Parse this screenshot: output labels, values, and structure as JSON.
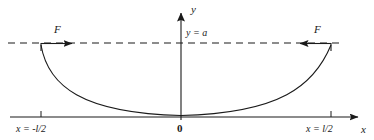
{
  "figure": {
    "type": "diagram",
    "width": 374,
    "height": 140,
    "background_color": "#ffffff",
    "stroke_color": "#1a1a1a"
  },
  "axes": {
    "y_axis_label": "y",
    "x_axis_label": "x",
    "origin_label": "0",
    "x_axis_y_px": 117,
    "y_axis_x_px": 181,
    "x_axis_from_px": 10,
    "x_axis_to_px": 365,
    "y_axis_from_px": 8,
    "y_axis_to_px": 120
  },
  "level_line": {
    "label": "y = a",
    "style": "dashed",
    "y_px": 43,
    "from_px": 8,
    "to_px": 340
  },
  "forces": [
    {
      "label": "F",
      "side": "left",
      "direction": "right",
      "anchor_x_px": 41,
      "tip_x_px": 78
    },
    {
      "label": "F",
      "side": "right",
      "direction": "left",
      "anchor_x_px": 331,
      "tip_x_px": 294
    }
  ],
  "ticks": [
    {
      "label": "x = -l/2",
      "x_px": 41
    },
    {
      "label": "x = l/2",
      "x_px": 331
    }
  ],
  "curve": {
    "name": "catenary",
    "endpoints_px": [
      [
        41,
        45
      ],
      [
        331,
        45
      ]
    ],
    "vertex_px": [
      181,
      115
    ],
    "path": "M 41 45 C 48 85, 80 112, 181 115 C 282 112, 314 85, 331 45"
  }
}
